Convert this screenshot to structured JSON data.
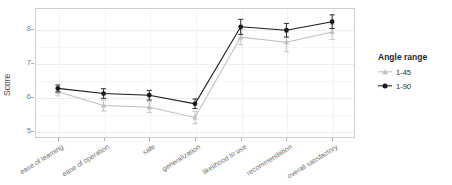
{
  "chart_data": {
    "type": "line",
    "title": "",
    "xlabel": "",
    "ylabel": "Score",
    "ylim": [
      4.8,
      8.6
    ],
    "yticks": [
      5,
      6,
      7,
      8
    ],
    "grid": true,
    "legend_position": "right",
    "legend_title": "Angle range",
    "categories": [
      "ease of learning",
      "ease of operation",
      "safe",
      "generalization",
      "likelihood to use",
      "recommendation",
      "overall satisfactory"
    ],
    "series": [
      {
        "name": "1-45",
        "marker": "triangle",
        "color": "#bfbfbf",
        "values": [
          6.15,
          5.75,
          5.7,
          5.4,
          7.75,
          7.6,
          7.9
        ],
        "errors": [
          0.12,
          0.16,
          0.16,
          0.18,
          0.22,
          0.28,
          0.22
        ]
      },
      {
        "name": "1-90",
        "marker": "circle",
        "color": "#1a1a1a",
        "values": [
          6.25,
          6.1,
          6.05,
          5.8,
          8.05,
          7.95,
          8.2
        ],
        "errors": [
          0.1,
          0.14,
          0.14,
          0.14,
          0.22,
          0.2,
          0.2
        ]
      }
    ]
  },
  "legend": {
    "title": "Angle range",
    "items": [
      {
        "label": "1-45",
        "color": "#bfbfbf",
        "marker": "triangle-icon"
      },
      {
        "label": "1-90",
        "color": "#1a1a1a",
        "marker": "circle-icon"
      }
    ]
  },
  "axes": {
    "y_title": "Score",
    "y_tick_labels": [
      "5",
      "6",
      "7",
      "8"
    ]
  },
  "colors": {
    "panel_background": "#ffffff",
    "panel_border": "#cfcfcf",
    "gridline": "#ededed",
    "tick_text": "#7a7a7a",
    "axis_title": "#4d4d4d",
    "series_light": "#bfbfbf",
    "series_dark": "#1a1a1a"
  }
}
